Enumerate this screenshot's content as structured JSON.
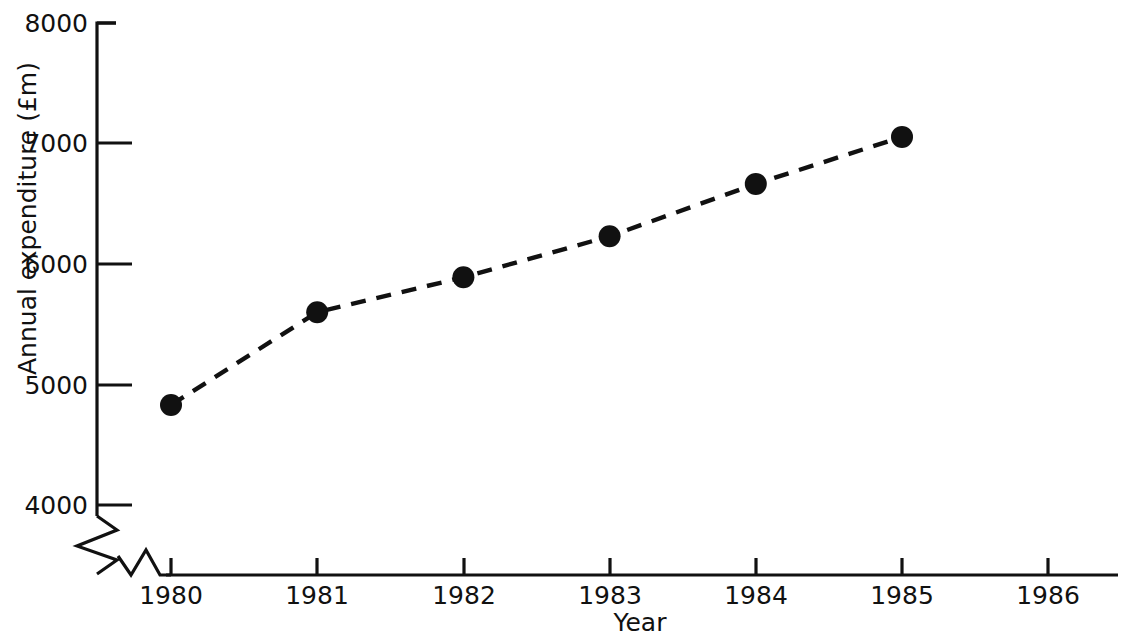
{
  "chart_data": {
    "type": "line",
    "title": "",
    "xlabel": "Year",
    "ylabel": "Annual expenditure (£m)",
    "x": [
      1980,
      1981,
      1982,
      1983,
      1984,
      1985
    ],
    "values": [
      4830,
      5600,
      5890,
      6230,
      6665,
      7055
    ],
    "series": [
      {
        "name": "Annual expenditure",
        "values": [
          4830,
          5600,
          5890,
          6230,
          6665,
          7055
        ]
      }
    ],
    "xtick_labels": [
      "1980",
      "1981",
      "1982",
      "1983",
      "1984",
      "1985",
      "1986"
    ],
    "xticks": [
      1980,
      1981,
      1982,
      1983,
      1984,
      1985,
      1986
    ],
    "ytick_labels": [
      "4000",
      "5000",
      "6000",
      "7000",
      "8000"
    ],
    "yticks": [
      4000,
      5000,
      6000,
      7000,
      8000
    ],
    "xlim": [
      1980,
      1986
    ],
    "ylim": [
      4000,
      8000
    ],
    "y_axis_break": true,
    "x_axis_break": true,
    "grid": false,
    "legend": "none",
    "line_style": "dashed",
    "marker": "filled-circle",
    "line_color": "#111111",
    "marker_color": "#111111",
    "background_color": "#ffffff"
  },
  "axis": {
    "y_title": "Annual expenditure (£m)",
    "x_title": "Year",
    "y_labels": {
      "t8000": "8000",
      "t7000": "7000",
      "t6000": "6000",
      "t5000": "5000",
      "t4000": "4000"
    },
    "x_labels": {
      "y1980": "1980",
      "y1981": "1981",
      "y1982": "1982",
      "y1983": "1983",
      "y1984": "1984",
      "y1985": "1985",
      "y1986": "1986"
    }
  },
  "header": {
    "cropped_title": ""
  }
}
